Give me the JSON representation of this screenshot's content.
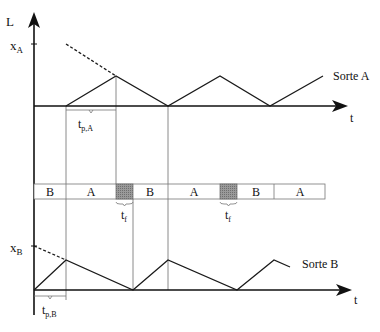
{
  "diagram": {
    "y_axis_label": "L",
    "x_axis_label_top": "t",
    "x_axis_label_bottom": "t",
    "level_A": {
      "main": "x",
      "sub": "A"
    },
    "level_B": {
      "main": "x",
      "sub": "B"
    },
    "series_A_label": "Sorte A",
    "series_B_label": "Sorte B",
    "tp_A": {
      "main": "t",
      "sub": "p,A"
    },
    "tp_B": {
      "main": "t",
      "sub": "p,B"
    },
    "tf_1": {
      "main": "t",
      "sub": "f"
    },
    "tf_2": {
      "main": "t",
      "sub": "f"
    },
    "schedule": [
      {
        "label": "B",
        "type": "product"
      },
      {
        "label": "A",
        "type": "product"
      },
      {
        "label": "",
        "type": "changeover"
      },
      {
        "label": "B",
        "type": "product"
      },
      {
        "label": "A",
        "type": "product"
      },
      {
        "label": "",
        "type": "changeover"
      },
      {
        "label": "B",
        "type": "product"
      },
      {
        "label": "A",
        "type": "product"
      }
    ],
    "colors": {
      "line": "#1a1a1a",
      "guide": "#888888",
      "changeover_fill": "#8c8c8c"
    }
  }
}
